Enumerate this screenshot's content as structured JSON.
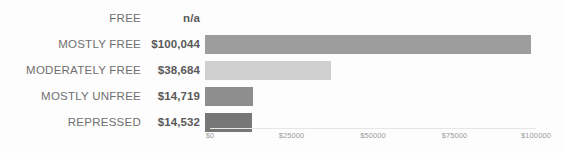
{
  "chart_data": {
    "type": "bar",
    "orientation": "horizontal",
    "title": "",
    "subtitle": "",
    "xlabel": "",
    "ylabel": "",
    "xlim": [
      0,
      100000
    ],
    "grid": false,
    "legend": null,
    "axis_tick_labels": [
      "$0",
      "$25000",
      "$50000",
      "$75000",
      "$100000"
    ],
    "axis_tick_values": [
      0,
      25000,
      50000,
      75000,
      100000
    ],
    "categories": [
      "FREE",
      "MOSTLY FREE",
      "MODERATELY FREE",
      "MOSTLY UNFREE",
      "REPRESSED"
    ],
    "values": [
      null,
      100044,
      38684,
      14719,
      14532
    ],
    "value_labels": [
      "n/a",
      "$100,044",
      "$38,684",
      "$14,719",
      "$14,532"
    ],
    "bar_colors": [
      "none",
      "#9d9d9d",
      "#cfcfcf",
      "#8e8e8e",
      "#777777"
    ],
    "rows": [
      {
        "category": "FREE",
        "value_label": "n/a",
        "value": null,
        "color": "none"
      },
      {
        "category": "MOSTLY FREE",
        "value_label": "$100,044",
        "value": 100044,
        "color": "#9d9d9d"
      },
      {
        "category": "MODERATELY FREE",
        "value_label": "$38,684",
        "value": 38684,
        "color": "#cfcfcf"
      },
      {
        "category": "MOSTLY UNFREE",
        "value_label": "$14,719",
        "value": 14719,
        "color": "#8e8e8e"
      },
      {
        "category": "REPRESSED",
        "value_label": "$14,532",
        "value": 14532,
        "color": "#777777"
      }
    ]
  },
  "colors": {
    "background": "#fdfdfd",
    "category_text": "#6f6f6f",
    "value_text": "#595959",
    "tick_text": "#9a9a9a",
    "axis_line": "#e6e6e6"
  }
}
